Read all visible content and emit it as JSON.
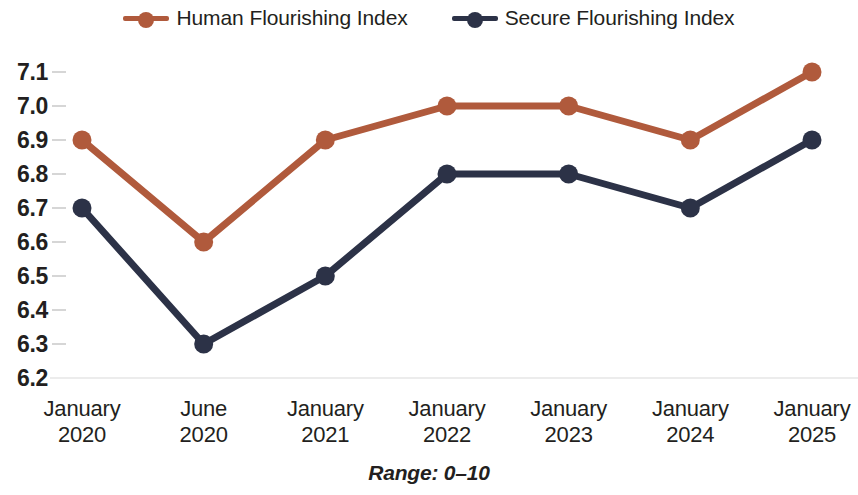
{
  "chart_data": {
    "type": "line",
    "title": "",
    "subtitle": "",
    "xlabel": "",
    "ylabel": "",
    "categories": [
      "January 2020",
      "June 2020",
      "January 2021",
      "January 2022",
      "January 2023",
      "January 2024",
      "January 2025"
    ],
    "category_lines": [
      [
        "January",
        "2020"
      ],
      [
        "June",
        "2020"
      ],
      [
        "January",
        "2021"
      ],
      [
        "January",
        "2022"
      ],
      [
        "January",
        "2023"
      ],
      [
        "January",
        "2024"
      ],
      [
        "January",
        "2025"
      ]
    ],
    "series": [
      {
        "name": "Human Flourishing Index",
        "color": "#b05a3c",
        "values": [
          6.9,
          6.6,
          6.9,
          7.0,
          7.0,
          6.9,
          7.1
        ]
      },
      {
        "name": "Secure Flourishing Index",
        "color": "#2c3247",
        "values": [
          6.7,
          6.3,
          6.5,
          6.8,
          6.8,
          6.7,
          6.9
        ]
      }
    ],
    "ylim": [
      6.2,
      7.1
    ],
    "ytick_step": 0.1,
    "ytick_labels": [
      "7.1",
      "7.0",
      "6.9",
      "6.8",
      "6.7",
      "6.6",
      "6.5",
      "6.4",
      "6.3",
      "6.2"
    ],
    "ytick_values": [
      7.1,
      7.0,
      6.9,
      6.8,
      6.7,
      6.6,
      6.5,
      6.4,
      6.3,
      6.2
    ],
    "grid": false,
    "baseline_gridline": true,
    "legend_position": "top-center",
    "marker": "circle",
    "footnote": "Range: 0–10"
  },
  "legend": {
    "items": [
      {
        "label": "Human Flourishing Index",
        "color": "#b05a3c"
      },
      {
        "label": "Secure Flourishing Index",
        "color": "#2c3247"
      }
    ]
  },
  "colors": {
    "human_flourishing": "#b05a3c",
    "secure_flourishing": "#2c3247",
    "text": "#231f20",
    "tick": "#c9c9c9",
    "gridline": "#ececec"
  }
}
